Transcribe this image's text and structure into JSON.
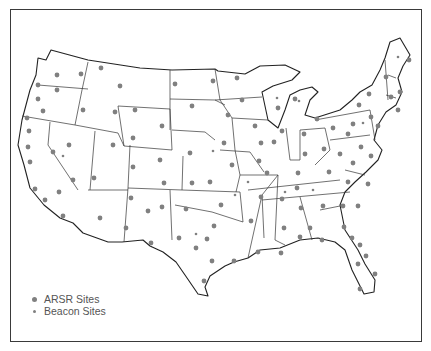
{
  "figure": {
    "type": "map",
    "region": "Contiguous United States",
    "colors": {
      "outline": "#222222",
      "arsr_dot": "#808080",
      "beacon_dot": "#808080",
      "background": "#ffffff"
    }
  },
  "legend": {
    "items": [
      {
        "symbol": "large-dot",
        "label": "ARSR Sites"
      },
      {
        "symbol": "small-dot",
        "label": "Beacon Sites"
      }
    ]
  },
  "sites": {
    "arsr": [
      [
        57,
        75
      ],
      [
        81,
        74
      ],
      [
        101,
        68
      ],
      [
        38,
        85
      ],
      [
        57,
        90
      ],
      [
        120,
        86
      ],
      [
        175,
        84
      ],
      [
        213,
        81
      ],
      [
        38,
        99
      ],
      [
        43,
        111
      ],
      [
        83,
        110
      ],
      [
        115,
        112
      ],
      [
        135,
        110
      ],
      [
        192,
        106
      ],
      [
        27,
        118
      ],
      [
        29,
        131
      ],
      [
        162,
        126
      ],
      [
        28,
        147
      ],
      [
        69,
        145
      ],
      [
        53,
        152
      ],
      [
        113,
        145
      ],
      [
        133,
        138
      ],
      [
        190,
        153
      ],
      [
        133,
        167
      ],
      [
        160,
        160
      ],
      [
        30,
        162
      ],
      [
        73,
        180
      ],
      [
        94,
        178
      ],
      [
        164,
        183
      ],
      [
        192,
        183
      ],
      [
        210,
        182
      ],
      [
        35,
        189
      ],
      [
        59,
        192
      ],
      [
        45,
        200
      ],
      [
        131,
        198
      ],
      [
        148,
        211
      ],
      [
        162,
        207
      ],
      [
        186,
        209
      ],
      [
        63,
        216
      ],
      [
        100,
        218
      ],
      [
        126,
        228
      ],
      [
        214,
        226
      ],
      [
        179,
        238
      ],
      [
        207,
        239
      ],
      [
        151,
        243
      ],
      [
        196,
        248
      ],
      [
        212,
        261
      ],
      [
        204,
        281
      ],
      [
        297,
        188
      ],
      [
        348,
        182
      ],
      [
        368,
        184
      ],
      [
        221,
        205
      ],
      [
        261,
        197
      ],
      [
        282,
        199
      ],
      [
        301,
        208
      ],
      [
        323,
        206
      ],
      [
        343,
        206
      ],
      [
        358,
        206
      ],
      [
        251,
        221
      ],
      [
        284,
        228
      ],
      [
        310,
        228
      ],
      [
        344,
        227
      ],
      [
        300,
        237
      ],
      [
        322,
        240
      ],
      [
        352,
        238
      ],
      [
        360,
        245
      ],
      [
        258,
        252
      ],
      [
        281,
        253
      ],
      [
        366,
        256
      ],
      [
        234,
        261
      ],
      [
        358,
        264
      ],
      [
        375,
        274
      ],
      [
        360,
        289
      ],
      [
        409,
        60
      ],
      [
        237,
        78
      ],
      [
        386,
        77
      ],
      [
        400,
        92
      ],
      [
        242,
        100
      ],
      [
        278,
        108
      ],
      [
        295,
        99
      ],
      [
        369,
        94
      ],
      [
        391,
        97
      ],
      [
        398,
        110
      ],
      [
        359,
        105
      ],
      [
        228,
        115
      ],
      [
        317,
        119
      ],
      [
        333,
        128
      ],
      [
        353,
        124
      ],
      [
        371,
        117
      ],
      [
        378,
        126
      ],
      [
        255,
        126
      ],
      [
        282,
        131
      ],
      [
        304,
        134
      ],
      [
        348,
        134
      ],
      [
        224,
        143
      ],
      [
        261,
        143
      ],
      [
        274,
        142
      ],
      [
        324,
        149
      ],
      [
        340,
        154
      ],
      [
        361,
        147
      ],
      [
        305,
        154
      ],
      [
        371,
        156
      ],
      [
        232,
        165
      ],
      [
        259,
        161
      ],
      [
        267,
        173
      ],
      [
        298,
        173
      ],
      [
        329,
        172
      ],
      [
        353,
        163
      ]
    ],
    "beacon": [
      [
        63,
        156
      ],
      [
        213,
        151
      ],
      [
        196,
        234
      ],
      [
        248,
        182
      ],
      [
        285,
        192
      ],
      [
        313,
        190
      ],
      [
        235,
        195
      ],
      [
        398,
        57
      ],
      [
        277,
        98
      ],
      [
        363,
        123
      ],
      [
        299,
        101
      ]
    ]
  }
}
